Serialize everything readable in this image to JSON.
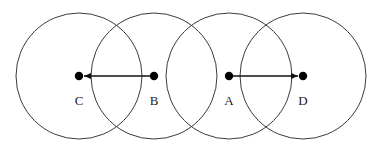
{
  "diagram": {
    "width": 382,
    "height": 151,
    "colors": {
      "circle_stroke": "#3a3a3a",
      "node_fill": "#000000",
      "arrow": "#111111",
      "label": "#222222",
      "background": "#ffffff"
    },
    "circle_radius": 63,
    "center_y": 76,
    "nodes": [
      {
        "id": "C",
        "label": "C",
        "x": 79
      },
      {
        "id": "B",
        "label": "B",
        "x": 154
      },
      {
        "id": "A",
        "label": "A",
        "x": 229
      },
      {
        "id": "D",
        "label": "D",
        "x": 303
      }
    ],
    "arrows": [
      {
        "from": "B",
        "to": "C"
      },
      {
        "from": "A",
        "to": "D"
      }
    ]
  }
}
